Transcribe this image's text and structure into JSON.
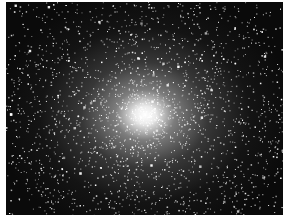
{
  "image": {
    "subject": "globular star cluster",
    "description": "Dense field of white stars on black background, brightness concentrated toward a bright core near the center",
    "colors": {
      "background": "#0a0a0a",
      "stars": "#ffffff",
      "border": "#ffffff"
    },
    "core": {
      "x": 139,
      "y": 113
    },
    "star_count": 2600,
    "seed": 20240
  }
}
